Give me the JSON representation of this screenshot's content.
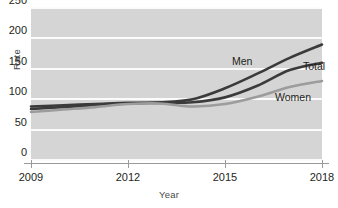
{
  "chart_data": {
    "type": "line",
    "title": "",
    "xlabel": "Year",
    "ylabel": "Rate",
    "xlim": [
      2009,
      2018
    ],
    "ylim": [
      0,
      250
    ],
    "grid": true,
    "legend_position": "inline-right",
    "x": [
      2009,
      2010,
      2011,
      2012,
      2013,
      2014,
      2015,
      2016,
      2017,
      2018
    ],
    "xticks": [
      "2009",
      "2012",
      "2015",
      "2018"
    ],
    "xtick_values": [
      2009,
      2012,
      2015,
      2018
    ],
    "yticks": [
      "0",
      "50",
      "100",
      "150",
      "200",
      "250"
    ],
    "ytick_values": [
      0,
      50,
      100,
      150,
      200,
      250
    ],
    "series": [
      {
        "name": "Men",
        "color": "#3b3b3b",
        "values": [
          88,
          90,
          92,
          94,
          95,
          100,
          118,
          142,
          168,
          190
        ]
      },
      {
        "name": "Total",
        "color": "#3b3b3b",
        "values": [
          84,
          87,
          90,
          93,
          94,
          95,
          103,
          122,
          148,
          160
        ]
      },
      {
        "name": "Women",
        "color": "#9c9c9c",
        "values": [
          79,
          83,
          87,
          92,
          93,
          88,
          92,
          104,
          120,
          130
        ]
      }
    ]
  },
  "axis": {
    "y_title": "Rate",
    "x_title": "Year"
  },
  "colors": {
    "panel": "#d5d5d5",
    "gridline": "#fbfbfb",
    "axis": "#9a9a9a",
    "text": "#231f20",
    "men": "#3b3b3b",
    "total": "#3b3b3b",
    "women": "#9c9c9c"
  }
}
